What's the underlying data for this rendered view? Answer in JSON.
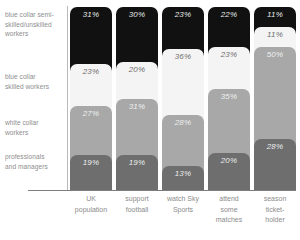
{
  "chart_data": {
    "type": "bar",
    "subtype": "stacked-bar-100-percent",
    "orientation": "vertical",
    "title": "",
    "subtitle": "",
    "xlabel": "",
    "ylabel": "",
    "ylim": [
      0,
      100
    ],
    "grid": false,
    "legend_position": "left-row-labels",
    "stack_order": "top-to-bottom",
    "categories": [
      "UK population",
      "support football",
      "watch Sky Sports",
      "attend some matches",
      "season ticket-holder"
    ],
    "category_lines": [
      [
        "UK",
        "population"
      ],
      [
        "support",
        "football"
      ],
      [
        "watch Sky",
        "Sports"
      ],
      [
        "attend",
        "some",
        "matches"
      ],
      [
        "season",
        "ticket-",
        "holder"
      ]
    ],
    "series": [
      {
        "name": "blue collar semi-skilled/unskilled workers",
        "name_lines": [
          "blue collar semi-",
          "skilled/unskilled",
          "workers"
        ],
        "tone": "tone-black",
        "color": "#111111",
        "values": [
          31,
          30,
          23,
          22,
          11
        ],
        "labels": [
          "31%",
          "30%",
          "23%",
          "22%",
          "11%"
        ]
      },
      {
        "name": "blue collar skilled workers",
        "name_lines": [
          "blue collar",
          "skilled workers"
        ],
        "tone": "tone-white",
        "color": "#f4f4f4",
        "values": [
          23,
          20,
          36,
          23,
          11
        ],
        "labels": [
          "23%",
          "20%",
          "36%",
          "23%",
          "11%"
        ]
      },
      {
        "name": "white collar workers",
        "name_lines": [
          "white collar",
          "workers"
        ],
        "tone": "tone-mid",
        "color": "#a8a8a8",
        "values": [
          27,
          31,
          28,
          35,
          50
        ],
        "labels": [
          "27%",
          "31%",
          "28%",
          "35%",
          "50%"
        ]
      },
      {
        "name": "professionals and managers",
        "name_lines": [
          "professionals",
          "and managers"
        ],
        "tone": "tone-dark",
        "color": "#6e6e6e",
        "values": [
          19,
          19,
          13,
          20,
          28
        ],
        "labels": [
          "19%",
          "19%",
          "13%",
          "20%",
          "28%"
        ]
      }
    ],
    "row_label_tops": [
      10,
      72,
      118,
      152
    ],
    "axis_color": "#7d7d7d",
    "divider_color": "#b9b9b9",
    "label_text_color": "#8e8e8e"
  }
}
